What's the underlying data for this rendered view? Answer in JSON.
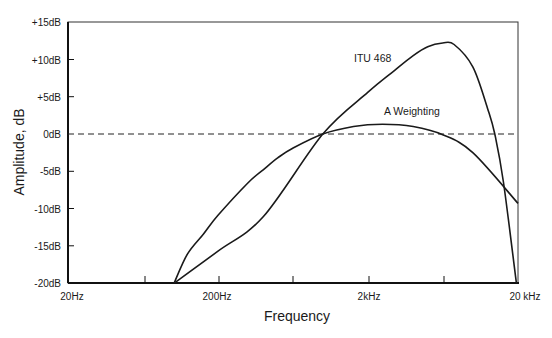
{
  "chart_data": {
    "type": "line",
    "title": "",
    "xlabel": "Frequency",
    "ylabel": "Amplitude, dB",
    "xscale": "log",
    "xlim": [
      20,
      20000
    ],
    "ylim": [
      -20,
      15
    ],
    "x_ticks": [
      "20Hz",
      "200Hz",
      "2kHz",
      "20 kHz"
    ],
    "y_ticks": [
      "+15dB",
      "+10dB",
      "+5dB",
      "0dB",
      "-5dB",
      "-10dB",
      "-15dB",
      "-20dB"
    ],
    "grid": false,
    "reference_line": {
      "y": 0,
      "style": "dashed"
    },
    "legend": "inline labels",
    "series": [
      {
        "name": "ITU 468",
        "x": [
          102,
          200,
          400,
          1000,
          2000,
          3000,
          4000,
          5000,
          6300,
          7500,
          10000,
          12500,
          14000,
          16000,
          19500
        ],
        "values": [
          -20,
          -15.7,
          -11.1,
          0,
          5.6,
          8.5,
          10.5,
          11.7,
          12.2,
          12.0,
          9.0,
          3.5,
          0,
          -6.5,
          -20
        ]
      },
      {
        "name": "A Weighting",
        "x": [
          102,
          125,
          160,
          200,
          315,
          400,
          500,
          630,
          1000,
          1600,
          2500,
          4000,
          6300,
          10000,
          20000
        ],
        "values": [
          -20,
          -16.1,
          -13.4,
          -10.9,
          -6.6,
          -4.8,
          -3.2,
          -1.9,
          0,
          1.0,
          1.3,
          1.0,
          -0.1,
          -2.5,
          -9.3
        ]
      }
    ]
  },
  "labels": {
    "ylabel": "Amplitude, dB",
    "xlabel": "Frequency",
    "itu": "ITU 468",
    "aw": "A Weighting",
    "y_ticks": [
      "+15dB",
      "+10dB",
      "+5dB",
      "0dB",
      "-5dB",
      "-10dB",
      "-15dB",
      "-20dB"
    ],
    "x_ticks": [
      "20Hz",
      "200Hz",
      "2kHz",
      "20 kHz"
    ]
  }
}
